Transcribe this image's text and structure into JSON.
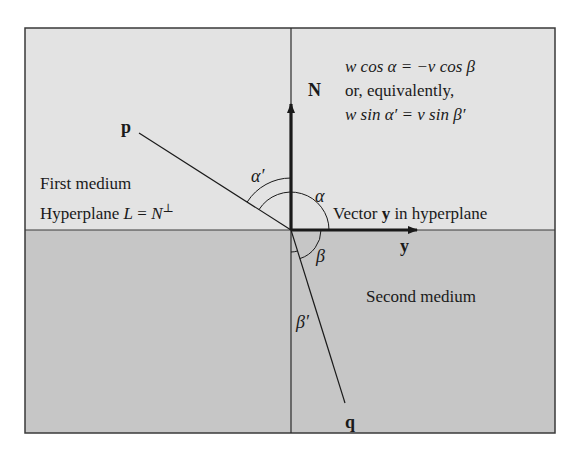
{
  "diagram": {
    "colors": {
      "first_medium": "#e3e3e3",
      "second_medium": "#c6c6c6",
      "ink": "#1a1a1a",
      "frame": "#3a3a3a"
    },
    "regions": {
      "first_medium_label": "First medium",
      "hyperplane_label_prefix": "Hyperplane ",
      "hyperplane_L": "L",
      "hyperplane_eq": " = ",
      "hyperplane_N": "N",
      "hyperplane_perp": "⊥",
      "second_medium_label": "Second medium"
    },
    "vectors": {
      "normal_label": "N",
      "y_label": "y",
      "y_caption_prefix": "Vector ",
      "y_caption_bold": "y",
      "y_caption_suffix": " in hyperplane",
      "incident_label": "p",
      "refracted_label": "q"
    },
    "angles": {
      "alpha_prime": "α′",
      "alpha": "α",
      "beta": "β",
      "beta_prime": "β′"
    },
    "equations": {
      "line1": "w cos α = −v cos β",
      "line2": "or, equivalently,",
      "line3": "w sin α′ = v sin β′"
    }
  }
}
